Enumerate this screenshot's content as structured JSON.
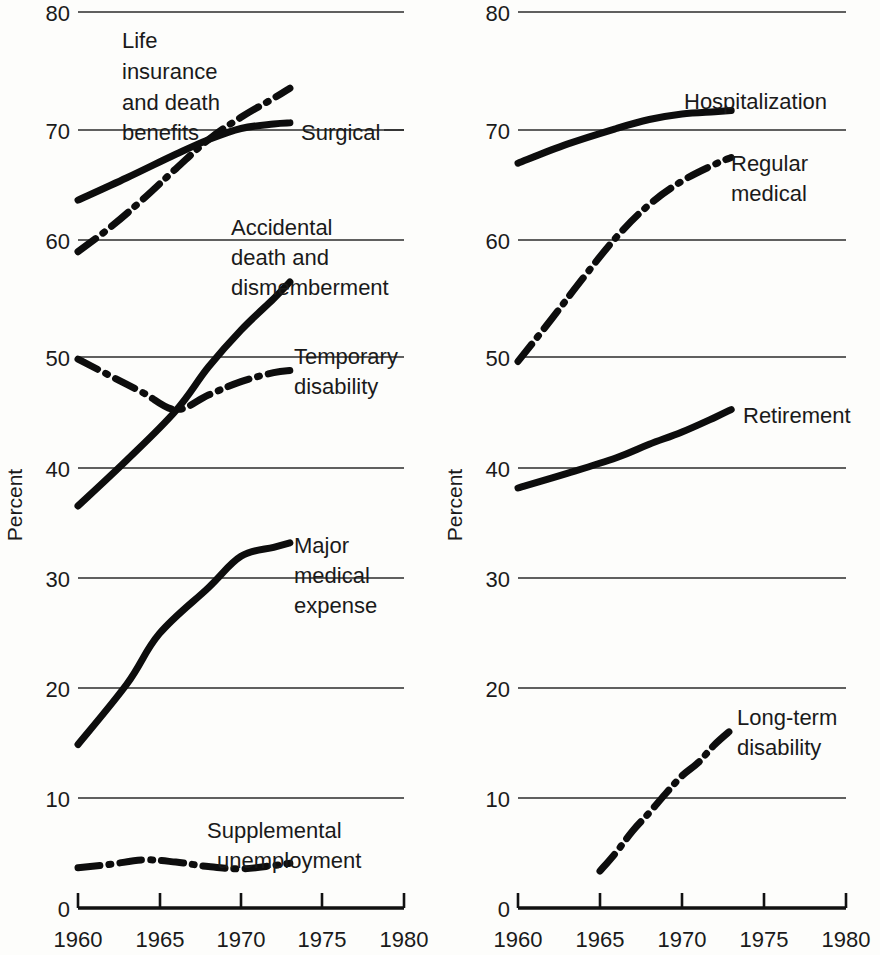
{
  "figure": {
    "y_axis_title": "Percent",
    "x_ticks": [
      "1960",
      "1965",
      "1970",
      "1975",
      "1980"
    ],
    "y_ticks": [
      "0",
      "10",
      "20",
      "30",
      "40",
      "50",
      "60",
      "70",
      "80"
    ],
    "line_color": "#0d0d0d",
    "grid_color": "#2b2b2b",
    "background": "#fdfdfb"
  },
  "labels": {
    "life_insurance": [
      "Life",
      "insurance",
      "and death",
      "benefits"
    ],
    "surgical": "Surgical",
    "accidental": [
      "Accidental",
      "death and",
      "dismemberment"
    ],
    "temporary": [
      "Temporary",
      "disability"
    ],
    "major_medical": [
      "Major",
      "medical",
      "expense"
    ],
    "supplemental": [
      "Supplemental",
      "unemployment"
    ],
    "hospitalization": "Hospitalization",
    "regular_medical": [
      "Regular",
      "medical"
    ],
    "retirement": "Retirement",
    "long_term": [
      "Long-term",
      "disability"
    ]
  },
  "chart_data": {
    "type": "line",
    "title": "",
    "xlabel": "",
    "ylabel": "Percent",
    "xlim": [
      1960,
      1980
    ],
    "ylim": [
      0,
      80
    ],
    "grid": true,
    "legend": "inline-annotations",
    "panels": [
      {
        "name": "left",
        "ylabel": "Percent",
        "series": [
          {
            "name": "Life insurance and death benefits",
            "style": "dash-dot",
            "x": [
              1960,
              1962,
              1964,
              1966,
              1968,
              1970,
              1972,
              1973
            ],
            "values": [
              58.6,
              60.8,
              63.3,
              66.0,
              68.6,
              70.6,
              72.3,
              73.2
            ]
          },
          {
            "name": "Surgical",
            "style": "solid",
            "x": [
              1960,
              1963,
              1966,
              1968,
              1970,
              1972,
              1973
            ],
            "values": [
              63.2,
              65.2,
              67.3,
              68.6,
              69.6,
              70.0,
              70.1
            ]
          },
          {
            "name": "Accidental death and dismemberment",
            "style": "solid",
            "x": [
              1960,
              1963,
              1966,
              1968,
              1970,
              1972,
              1973
            ],
            "values": [
              35.9,
              40.0,
              44.4,
              48.3,
              51.6,
              54.4,
              55.9
            ]
          },
          {
            "name": "Temporary disability",
            "style": "dash-dot",
            "x": [
              1960,
              1962,
              1964,
              1966,
              1968,
              1970,
              1972,
              1973
            ],
            "values": [
              49.0,
              47.5,
              46.0,
              44.5,
              45.8,
              47.0,
              47.8,
              48.0
            ]
          },
          {
            "name": "Major medical expense",
            "style": "solid",
            "x": [
              1960,
              1963,
              1965,
              1968,
              1970,
              1972,
              1973
            ],
            "values": [
              14.6,
              20.0,
              24.5,
              28.6,
              31.4,
              32.2,
              32.6
            ]
          },
          {
            "name": "Supplemental unemployment",
            "style": "dash-dot",
            "x": [
              1960,
              1962,
              1964,
              1966,
              1968,
              1970,
              1972,
              1973
            ],
            "values": [
              3.6,
              3.9,
              4.3,
              4.1,
              3.7,
              3.5,
              3.8,
              4.0
            ]
          }
        ]
      },
      {
        "name": "right",
        "ylabel": "Percent",
        "series": [
          {
            "name": "Hospitalization",
            "style": "solid",
            "x": [
              1960,
              1963,
              1966,
              1968,
              1970,
              1972,
              1973
            ],
            "values": [
              66.5,
              68.2,
              69.6,
              70.4,
              70.9,
              71.1,
              71.2
            ]
          },
          {
            "name": "Regular medical",
            "style": "dash-dot",
            "x": [
              1960,
              1962,
              1964,
              1966,
              1968,
              1970,
              1972,
              1973
            ],
            "values": [
              48.8,
              52.5,
              56.3,
              59.9,
              62.8,
              64.9,
              66.4,
              67.0
            ]
          },
          {
            "name": "Retirement",
            "style": "solid",
            "x": [
              1960,
              1963,
              1966,
              1968,
              1970,
              1972,
              1973
            ],
            "values": [
              37.5,
              38.8,
              40.2,
              41.4,
              42.5,
              43.8,
              44.5
            ]
          },
          {
            "name": "Long-term disability",
            "style": "dash-dot",
            "x": [
              1965,
              1966,
              1967,
              1968,
              1969,
              1970,
              1971,
              1972,
              1973
            ],
            "values": [
              3.3,
              5.0,
              6.9,
              8.5,
              10.2,
              11.8,
              13.0,
              14.6,
              15.9
            ]
          }
        ]
      }
    ]
  }
}
